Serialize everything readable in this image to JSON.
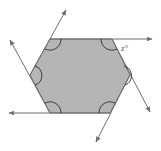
{
  "diagram": {
    "type": "hexagon-exterior-angles",
    "shape": "regular hexagon",
    "fill_color": "#b5b5b5",
    "stroke_color": "#6e6e6e",
    "vertices": [
      {
        "name": "top-left",
        "x": 50,
        "y": 39
      },
      {
        "name": "top-right",
        "x": 112,
        "y": 39
      },
      {
        "name": "right",
        "x": 130,
        "y": 75
      },
      {
        "name": "bottom-right",
        "x": 110,
        "y": 113
      },
      {
        "name": "bottom-left",
        "x": 50,
        "y": 113
      },
      {
        "name": "left",
        "x": 30,
        "y": 75
      }
    ],
    "interior_angle_marks": 6,
    "extended_sides_with_arrows": 6,
    "exterior_angle_label": "z°"
  }
}
